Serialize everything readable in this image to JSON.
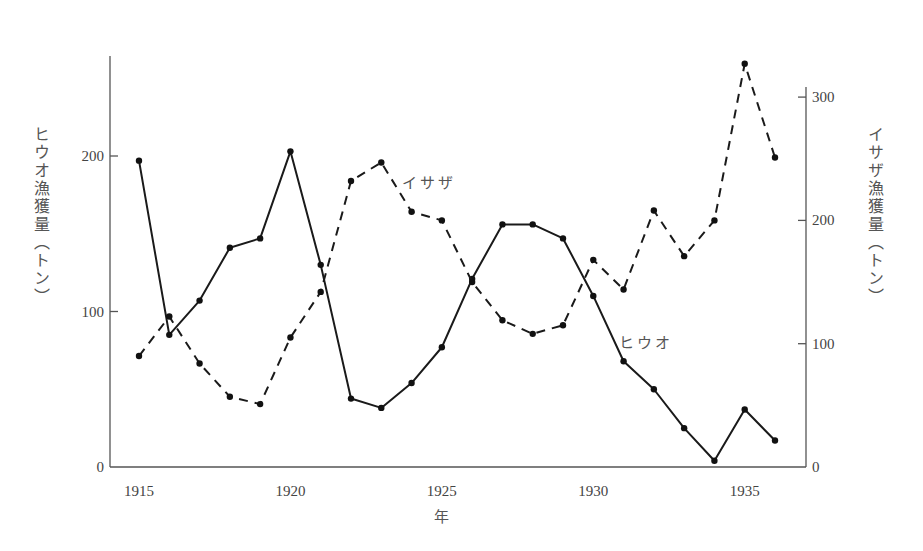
{
  "chart_data": {
    "type": "line",
    "title": "",
    "xlabel": "年",
    "ylabel": "ヒウオ漁獲量（トン）",
    "ylabel_right": "イサザ漁獲量（トン）",
    "x": [
      1915,
      1916,
      1917,
      1918,
      1919,
      1920,
      1921,
      1922,
      1923,
      1924,
      1925,
      1926,
      1927,
      1928,
      1929,
      1930,
      1931,
      1932,
      1933,
      1934,
      1935,
      1936
    ],
    "xticks": [
      1915,
      1920,
      1925,
      1930,
      1935
    ],
    "yticks_left": [
      0,
      100,
      200
    ],
    "yticks_right": [
      0,
      100,
      200,
      300
    ],
    "ylim_left": [
      0,
      270
    ],
    "ylim_right": [
      0,
      340
    ],
    "xlim": [
      1914.2,
      1936.8
    ],
    "grid": false,
    "legend": "inline labels",
    "series": [
      {
        "name": "ヒウオ",
        "axis": "left",
        "style": "solid",
        "values": [
          197,
          85,
          107,
          141,
          147,
          203,
          130,
          44,
          38,
          54,
          77,
          121,
          156,
          156,
          147,
          110,
          68,
          50,
          25,
          4,
          37,
          17
        ]
      },
      {
        "name": "イサザ",
        "axis": "right",
        "style": "dashed",
        "values": [
          90,
          122,
          84,
          57,
          51,
          105,
          142,
          232,
          247,
          207,
          200,
          150,
          119,
          108,
          115,
          168,
          144,
          208,
          171,
          200,
          327,
          251
        ]
      }
    ],
    "annotations": [
      {
        "text": "イサザ",
        "near_x": 1924.5,
        "series": "イサザ"
      },
      {
        "text": "ヒウオ",
        "near_x": 1931.5,
        "series": "ヒウオ"
      }
    ]
  }
}
